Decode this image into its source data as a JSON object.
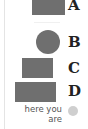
{
  "diagram": {
    "items": [
      {
        "label": "A",
        "shape": "rectangle",
        "color": "#6f6f6f"
      },
      {
        "label": "B",
        "shape": "circle",
        "color": "#6f6f6f"
      },
      {
        "label": "C",
        "shape": "rectangle",
        "color": "#6f6f6f"
      },
      {
        "label": "D",
        "shape": "rectangle",
        "color": "#6f6f6f"
      }
    ],
    "marker": {
      "text_line1": "here you",
      "text_line2": "are",
      "color": "#cfcfcf"
    }
  }
}
